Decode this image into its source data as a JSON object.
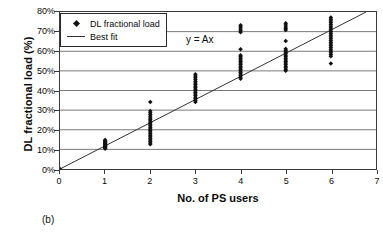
{
  "figure": {
    "caption": "(b)"
  },
  "chart_data": {
    "type": "scatter",
    "title": "",
    "xlabel": "No. of PS users",
    "ylabel": "DL fractional load (%)",
    "xlim": [
      0,
      7
    ],
    "ylim": [
      0,
      80
    ],
    "xticks": [
      0,
      1,
      2,
      3,
      4,
      5,
      6,
      7
    ],
    "xticklabels": [
      "0",
      "1",
      "2",
      "3",
      "4",
      "5",
      "6",
      "7"
    ],
    "yticks": [
      0,
      10,
      20,
      30,
      40,
      50,
      60,
      70,
      80
    ],
    "yticklabels": [
      "0%",
      "10%",
      "20%",
      "30%",
      "40%",
      "50%",
      "60%",
      "70%",
      "80%"
    ],
    "grid": "horizontal",
    "legend_position": "top-left",
    "annotations": [
      {
        "text": "y = Ax",
        "x": 3.3,
        "y": 71
      }
    ],
    "series": [
      {
        "name": "DL fractional load",
        "type": "scatter",
        "marker": "diamond",
        "color": "#111111",
        "points": [
          [
            0,
            0.0
          ],
          [
            1,
            10.3
          ],
          [
            1,
            10.7
          ],
          [
            1,
            11.0
          ],
          [
            1,
            11.3
          ],
          [
            1,
            11.6
          ],
          [
            1,
            11.9
          ],
          [
            1,
            12.2
          ],
          [
            1,
            12.6
          ],
          [
            1,
            12.9
          ],
          [
            1,
            13.2
          ],
          [
            1,
            13.6
          ],
          [
            1,
            14.0
          ],
          [
            1,
            14.4
          ],
          [
            1,
            14.8
          ],
          [
            2,
            34.1
          ],
          [
            2,
            29.6
          ],
          [
            2,
            28.7
          ],
          [
            2,
            27.8
          ],
          [
            2,
            26.9
          ],
          [
            2,
            26.0
          ],
          [
            2,
            25.2
          ],
          [
            2,
            24.4
          ],
          [
            2,
            23.6
          ],
          [
            2,
            22.8
          ],
          [
            2,
            22.0
          ],
          [
            2,
            21.2
          ],
          [
            2,
            20.4
          ],
          [
            2,
            19.6
          ],
          [
            2,
            18.8
          ],
          [
            2,
            18.0
          ],
          [
            2,
            17.2
          ],
          [
            2,
            16.4
          ],
          [
            2,
            15.6
          ],
          [
            2,
            14.8
          ],
          [
            2,
            14.0
          ],
          [
            2,
            13.2
          ],
          [
            2,
            12.6
          ],
          [
            3,
            48.3
          ],
          [
            3,
            47.4
          ],
          [
            3,
            46.5
          ],
          [
            3,
            45.6
          ],
          [
            3,
            44.7
          ],
          [
            3,
            43.8
          ],
          [
            3,
            43.0
          ],
          [
            3,
            42.2
          ],
          [
            3,
            41.4
          ],
          [
            3,
            40.6
          ],
          [
            3,
            39.8
          ],
          [
            3,
            39.0
          ],
          [
            3,
            38.2
          ],
          [
            3,
            37.4
          ],
          [
            3,
            36.6
          ],
          [
            3,
            35.8
          ],
          [
            3,
            35.0
          ],
          [
            3,
            34.2
          ],
          [
            4,
            73.2
          ],
          [
            4,
            72.3
          ],
          [
            4,
            71.4
          ],
          [
            4,
            70.4
          ],
          [
            4,
            69.7
          ],
          [
            4,
            61.0
          ],
          [
            4,
            58.0
          ],
          [
            4,
            57.2
          ],
          [
            4,
            56.4
          ],
          [
            4,
            55.6
          ],
          [
            4,
            54.8
          ],
          [
            4,
            54.0
          ],
          [
            4,
            53.2
          ],
          [
            4,
            52.4
          ],
          [
            4,
            51.6
          ],
          [
            4,
            50.8
          ],
          [
            4,
            50.0
          ],
          [
            4,
            49.2
          ],
          [
            4,
            48.4
          ],
          [
            4,
            47.6
          ],
          [
            4,
            46.8
          ],
          [
            4,
            46.0
          ],
          [
            5,
            74.3
          ],
          [
            5,
            73.4
          ],
          [
            5,
            72.4
          ],
          [
            5,
            71.5
          ],
          [
            5,
            70.8
          ],
          [
            5,
            65.2
          ],
          [
            5,
            61.2
          ],
          [
            5,
            60.4
          ],
          [
            5,
            59.6
          ],
          [
            5,
            58.8
          ],
          [
            5,
            58.0
          ],
          [
            5,
            57.2
          ],
          [
            5,
            56.4
          ],
          [
            5,
            55.6
          ],
          [
            5,
            54.8
          ],
          [
            5,
            54.0
          ],
          [
            5,
            53.2
          ],
          [
            5,
            52.4
          ],
          [
            5,
            51.6
          ],
          [
            5,
            50.8
          ],
          [
            5,
            50.1
          ],
          [
            6,
            77.2
          ],
          [
            6,
            76.3
          ],
          [
            6,
            75.4
          ],
          [
            6,
            74.5
          ],
          [
            6,
            73.6
          ],
          [
            6,
            72.7
          ],
          [
            6,
            71.8
          ],
          [
            6,
            70.9
          ],
          [
            6,
            70.0
          ],
          [
            6,
            69.1
          ],
          [
            6,
            68.2
          ],
          [
            6,
            67.3
          ],
          [
            6,
            66.4
          ],
          [
            6,
            65.5
          ],
          [
            6,
            64.6
          ],
          [
            6,
            63.7
          ],
          [
            6,
            62.8
          ],
          [
            6,
            61.9
          ],
          [
            6,
            61.0
          ],
          [
            6,
            60.1
          ],
          [
            6,
            59.2
          ],
          [
            6,
            58.3
          ],
          [
            6,
            57.4
          ],
          [
            6,
            53.8
          ]
        ]
      },
      {
        "name": "Best fit",
        "type": "line",
        "color": "#333333",
        "equation": "y = Ax",
        "slope": 11.8,
        "intercept": 0,
        "endpoints": [
          [
            0,
            0
          ],
          [
            6.78,
            80
          ]
        ]
      }
    ]
  },
  "legend": {
    "entries": [
      {
        "label": "DL fractional load",
        "marker": "diamond"
      },
      {
        "label": "Best fit",
        "marker": "line"
      }
    ]
  }
}
